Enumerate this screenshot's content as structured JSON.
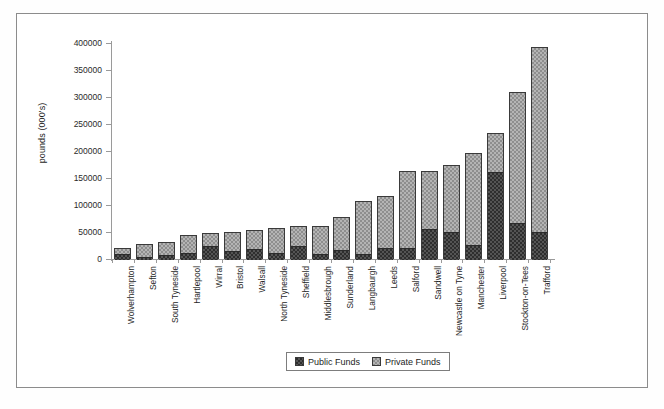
{
  "chart_data": {
    "type": "bar",
    "stacked": true,
    "title": "",
    "subtitle": "",
    "xlabel": "",
    "ylabel": "pounds (000's)",
    "ylim": [
      0,
      400000
    ],
    "ytick_labels": [
      "400000",
      "350000",
      "300000",
      "250000",
      "200000",
      "150000",
      "100000",
      "50000",
      "0"
    ],
    "ytick_values": [
      400000,
      350000,
      300000,
      250000,
      200000,
      150000,
      100000,
      50000,
      0
    ],
    "grid": false,
    "legend_position": "bottom-center",
    "categories": [
      "Wolverhampton",
      "Sefton",
      "South Tyneside",
      "Hartlepool",
      "Wirral",
      "Bristol",
      "Walsall",
      "North Tyneside",
      "Sheffield",
      "Middlesbrough",
      "Sunderland",
      "Langbaurgh",
      "Leeds",
      "Salford",
      "Sandwell",
      "Newcastle on Tyne",
      "Manchester",
      "Liverpool",
      "Stockton-on-Tees",
      "Trafford"
    ],
    "series": [
      {
        "name": "Public Funds",
        "color": "#2e2e2e",
        "values": [
          11000,
          6000,
          9000,
          13000,
          25000,
          16000,
          20000,
          13000,
          26000,
          11000,
          18000,
          11000,
          23000,
          22000,
          58000,
          51000,
          28000,
          163000,
          68000,
          52000
        ]
      },
      {
        "name": "Private Funds",
        "color": "#b4b4b4",
        "values": [
          10000,
          22000,
          23000,
          32000,
          23000,
          34000,
          33000,
          45000,
          35000,
          51000,
          59000,
          97000,
          93000,
          141000,
          105000,
          123000,
          169000,
          71000,
          242000,
          341000
        ]
      }
    ],
    "totals": [
      21000,
      28000,
      32000,
      45000,
      48000,
      50000,
      53000,
      58000,
      61000,
      62000,
      77000,
      108000,
      116000,
      163000,
      163000,
      174000,
      197000,
      234000,
      310000,
      393000
    ]
  },
  "legend": {
    "items": [
      {
        "label": "Public Funds",
        "swatch": "public"
      },
      {
        "label": "Private Funds",
        "swatch": "private"
      }
    ]
  }
}
